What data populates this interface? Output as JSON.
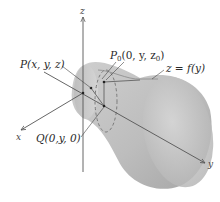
{
  "figure": {
    "axes": {
      "x_label": "x",
      "y_label": "y",
      "z_label": "z"
    },
    "labels": {
      "point_p": "P(x, y, z)",
      "point_p0_main": "P",
      "point_p0_sub": "0",
      "point_p0_args": "(0, y, z",
      "point_p0_args_sub": "0",
      "point_p0_close": ")",
      "curve": "z = f(y)",
      "point_q": "Q(0,y, 0)"
    },
    "colors": {
      "surface_light": "#d9d9d9",
      "surface_dark": "#a9a9a9",
      "axis": "#555555",
      "text": "#2a2a2a"
    }
  }
}
